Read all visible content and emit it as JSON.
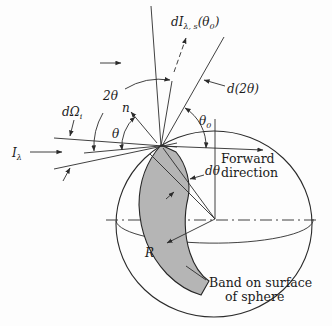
{
  "figure": {
    "colors": {
      "background": "#fdfdfd",
      "line": "#2b2b2b",
      "band_fill": "#b5b5b5",
      "text": "#1b1b1b"
    },
    "labels": {
      "scattered_intensity": {
        "pre": "dI",
        "sub": "λ, s",
        "mid": "(θ",
        "sub2": "0",
        "post": ")"
      },
      "d_two_theta": "d(2θ)",
      "two_theta": "2θ",
      "normal": "n",
      "theta": "θ",
      "theta_zero": {
        "base": "θ",
        "sub": "0"
      },
      "solid_angle": {
        "base": "dΩ",
        "sub": "i"
      },
      "incident_intensity": {
        "base": "I",
        "sub": "λ"
      },
      "d_theta": "dθ",
      "forward": {
        "line1": "Forward",
        "line2": "direction"
      },
      "radius": "R",
      "band_caption": {
        "line1": "Band on surface",
        "line2": "of sphere"
      }
    }
  }
}
